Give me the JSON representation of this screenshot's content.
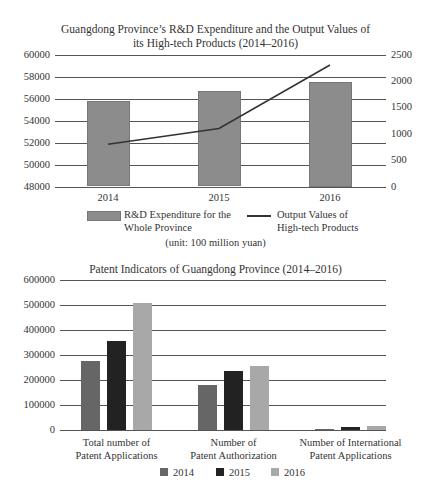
{
  "chart_data": [
    {
      "type": "bar+line",
      "title": "Guangdong Province’s R&D Expenditure and the Output Values of its High-tech Products (2014–2016)",
      "title_lines": [
        "Guangdong Province’s R&D Expenditure and the Output Values of",
        "its High-tech Products (2014–2016)"
      ],
      "categories": [
        "2014",
        "2015",
        "2016"
      ],
      "series": [
        {
          "name": "R&D Expenditure for the Whole Province",
          "type": "bar",
          "axis": "left",
          "color": "#8c8c8c",
          "values": [
            55800,
            56700,
            57500
          ]
        },
        {
          "name": "Output Values of High-tech Products",
          "type": "line",
          "axis": "right",
          "color": "#333333",
          "values": [
            800,
            1100,
            2300
          ]
        }
      ],
      "left_axis": {
        "ticks": [
          "60000",
          "58000",
          "56000",
          "54000",
          "52000",
          "50000",
          "48000"
        ],
        "ylim": [
          48000,
          60000
        ]
      },
      "right_axis": {
        "ticks": [
          "2500",
          "2000",
          "1500",
          "1000",
          "500",
          "0"
        ],
        "ylim": [
          0,
          2500
        ]
      },
      "legend": [
        {
          "label_lines": [
            "R&D Expenditure for the",
            "Whole Province"
          ],
          "kind": "bar"
        },
        {
          "label_lines": [
            "Output Values of",
            "High-tech Products"
          ],
          "kind": "line"
        }
      ],
      "note": "(unit: 100 million yuan)",
      "grid": true,
      "legend_position": "bottom"
    },
    {
      "type": "bar",
      "title": "Patent Indicators of Guangdong Province (2014–2016)",
      "categories": [
        "Total number of Patent Applications",
        "Number of Patent Authorization",
        "Number of International Patent Applications"
      ],
      "category_lines": [
        [
          "Total number of",
          "Patent Applications"
        ],
        [
          "Number of",
          "Patent Authorization"
        ],
        [
          "Number of International",
          "Patent Applications"
        ]
      ],
      "series": [
        {
          "name": "2014",
          "color": "#666666",
          "values": [
            275000,
            179000,
            4000
          ]
        },
        {
          "name": "2015",
          "color": "#222222",
          "values": [
            355000,
            235000,
            11000
          ]
        },
        {
          "name": "2016",
          "color": "#a8a8a8",
          "values": [
            505000,
            255000,
            15000
          ]
        }
      ],
      "y_axis": {
        "ticks": [
          "600000",
          "500000",
          "400000",
          "300000",
          "200000",
          "100000",
          "0"
        ],
        "ylim": [
          0,
          600000
        ]
      },
      "grid": true,
      "legend_position": "bottom"
    }
  ]
}
